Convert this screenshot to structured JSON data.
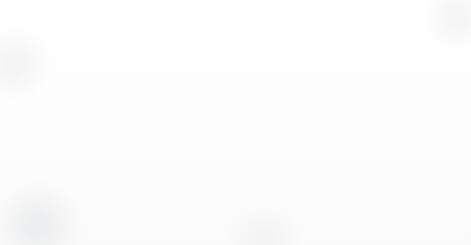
{
  "figure": {
    "background_color": "#fdfdfd",
    "width": 471,
    "height": 245,
    "caption_font_color": "#3b3b3b"
  },
  "panels": [
    {
      "id": "panel-a",
      "label": "(a)",
      "subject": "endohedral-fullerene-cage",
      "description": "C60 fullerene cage with a single dark encapsulated atom at the centre",
      "cage": {
        "atom_count": 60,
        "atom_fill": "#b5b5b5",
        "atom_stroke": "#6d6d6d",
        "atom_radius": 11,
        "bond_fill": "#c6c6c6",
        "bond_stroke": "#6d6d6d",
        "bond_width": 4.6
      },
      "encapsulated_atom": {
        "count": 1,
        "fill": "#2b2320",
        "stroke": "#1a1512",
        "radius": 17,
        "center_x": 113,
        "center_y": 113
      }
    },
    {
      "id": "panel-b",
      "label": "(b)",
      "subject": "dark-cage-cluster",
      "description": "Smaller dark cage cluster of bonded atoms drawn in dark grey",
      "cage": {
        "atom_count": 28,
        "atom_fill": "#6e6e6e",
        "atom_stroke": "#3a3a3a",
        "atom_radius": 13.5,
        "bond_fill": "#5f5f5f",
        "bond_stroke": "#3a3a3a",
        "bond_width": 8.5
      }
    }
  ],
  "chart_data": {
    "type": "diagram",
    "title": "",
    "panels": [
      {
        "label": "(a)",
        "kind": "ball-and-stick molecular cage",
        "shell_atoms": 60,
        "interior_atoms": 1,
        "shell_color": "#b5b5b5",
        "interior_color": "#2b2320"
      },
      {
        "label": "(b)",
        "kind": "ball-and-stick molecular cage",
        "shell_atoms": 28,
        "interior_atoms": 0,
        "shell_color": "#6e6e6e"
      }
    ]
  }
}
